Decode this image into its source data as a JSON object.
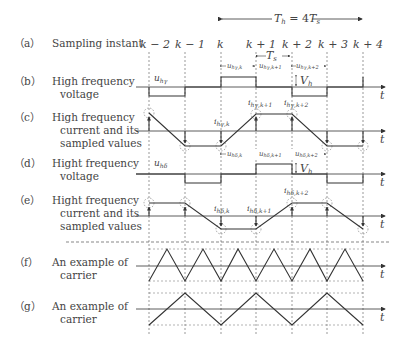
{
  "header": {
    "period_label": "T_h = 4T_s",
    "period_main": "T",
    "period_sub": "h",
    "period_eq": " = 4",
    "period_T2": "T",
    "period_sub2": "s"
  },
  "sampling_instants": [
    "k − 2",
    "k − 1",
    "k",
    "k + 1",
    "k + 2",
    "k + 3",
    "k + 4"
  ],
  "rows": [
    {
      "tag": "（a）",
      "line1": "Sampling instant",
      "line2": ""
    },
    {
      "tag": "（b）",
      "line1": "High frequency",
      "line2": "voltage"
    },
    {
      "tag": "（c）",
      "line1": "High frequency",
      "line2": "current and its",
      "line3": "sampled values"
    },
    {
      "tag": "（d）",
      "line1": "Hight frequency",
      "line2": "voltage"
    },
    {
      "tag": "（e）",
      "line1": "Hight frequency",
      "line2": "current and its",
      "line3": "sampled values"
    },
    {
      "tag": "（f）",
      "line1": "An example of",
      "line2": "carrier"
    },
    {
      "tag": "（g）",
      "line1": "An example of",
      "line2": "carrier"
    }
  ],
  "annotations": {
    "Ts": "T",
    "Ts_sub": "s",
    "Vh": "V",
    "Vh_sub": "h",
    "u_hgamma": "u",
    "u_hgamma_sub": "hγ",
    "u_hdelta": "u",
    "u_hdelta_sub": "hδ",
    "u_hgamma_k": "hγ,k",
    "u_hgamma_k1": "hγ,k+1",
    "u_hgamma_k2": "hγ,k+2",
    "u_hdelta_k": "hδ,k",
    "u_hdelta_k1": "hδ,k+1",
    "u_hdelta_k2": "hδ,k+2",
    "i_hgamma_k": "hγ,k",
    "i_hgamma_k1": "hγ,k+1",
    "i_hgamma_k2": "hγ,k+2",
    "i_hdelta_k": "hδ,k",
    "i_hdelta_k1": "hδ,k+1",
    "i_hdelta_k2": "hδ,k+2",
    "time_axis": "t"
  }
}
